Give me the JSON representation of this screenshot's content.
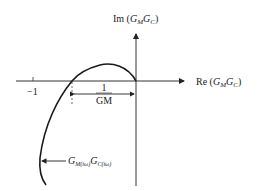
{
  "diagram": {
    "type": "nyquist-plot",
    "axes": {
      "imag_label": {
        "prefix": "Im",
        "var1": "G",
        "sub1": "M",
        "var2": "G",
        "sub2": "C"
      },
      "real_label": {
        "prefix": "Re",
        "var1": "G",
        "sub1": "M",
        "var2": "G",
        "sub2": "C"
      }
    },
    "tick_label_minus_one": "−1",
    "gain_margin": {
      "numerator": "1",
      "denominator": "GM"
    },
    "curve_label": {
      "var1": "G",
      "sub1": "M(iω)",
      "var2": "G",
      "sub2": "C(iω)"
    },
    "colors": {
      "line": "#1a1a1a",
      "axis": "#333333",
      "background": "#ffffff"
    }
  }
}
